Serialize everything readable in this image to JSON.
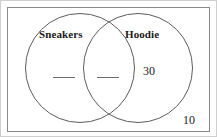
{
  "figure": {
    "universe_label": "",
    "outside_value": "10"
  },
  "sets": [
    {
      "id": "sneakers",
      "label": "Sneakers",
      "region_value": "___"
    },
    {
      "id": "hoodie",
      "label": "Hoodie",
      "region_value": "30"
    }
  ],
  "intersection": {
    "label": "Sneakers and Hoodie",
    "value": "___"
  },
  "colors": {
    "circle_stroke": "#5c5c5c",
    "rect_stroke": "#8a8a8a",
    "text": "#1a1a1a",
    "blank_rule": "#6e6e6e",
    "background": "#ffffff"
  },
  "chart_data": {
    "type": "venn",
    "sets": [
      "Sneakers",
      "Hoodie"
    ],
    "regions": [
      {
        "region": "Sneakers only",
        "value": null,
        "display": "___"
      },
      {
        "region": "Sneakers and Hoodie",
        "value": null,
        "display": "___"
      },
      {
        "region": "Hoodie only",
        "value": 30,
        "display": "30"
      },
      {
        "region": "Neither (outside)",
        "value": 10,
        "display": "10"
      }
    ],
    "legend": "none",
    "grid": false
  }
}
